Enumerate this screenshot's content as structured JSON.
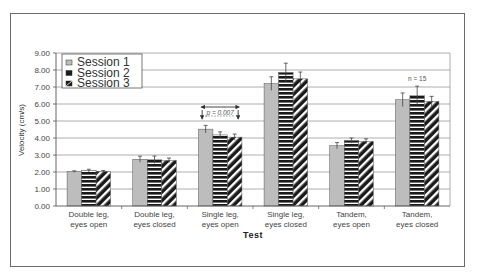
{
  "chart_data": {
    "type": "bar",
    "title": "",
    "xlabel": "Test",
    "ylabel": "Velocity (cm/s)",
    "ylim": [
      0,
      9
    ],
    "ytick_step": 1,
    "yticks": [
      "0.00",
      "1.00",
      "2.00",
      "3.00",
      "4.00",
      "5.00",
      "6.00",
      "7.00",
      "8.00",
      "9.00"
    ],
    "grid": true,
    "legend_position": "upper-left",
    "categories": [
      [
        "Double leg,",
        "eyes open"
      ],
      [
        "Double leg,",
        "eyes closed"
      ],
      [
        "Single leg,",
        "eyes open"
      ],
      [
        "Single leg,",
        "eyes closed"
      ],
      [
        "Tandem,",
        "eyes open"
      ],
      [
        "Tandem,",
        "eyes closed"
      ]
    ],
    "series": [
      {
        "name": "Session 1",
        "pattern": "solid-gray",
        "values": [
          2.02,
          2.75,
          4.52,
          7.2,
          3.55,
          6.25
        ],
        "errors": [
          0.05,
          0.18,
          0.22,
          0.4,
          0.18,
          0.4
        ]
      },
      {
        "name": "Session 2",
        "pattern": "horizontal-stripes",
        "values": [
          2.08,
          2.72,
          4.18,
          7.85,
          3.85,
          6.5
        ],
        "errors": [
          0.08,
          0.22,
          0.18,
          0.55,
          0.15,
          0.55
        ]
      },
      {
        "name": "Session 3",
        "pattern": "diagonal-stripes",
        "values": [
          2.03,
          2.68,
          4.05,
          7.48,
          3.8,
          6.15
        ],
        "errors": [
          0.06,
          0.14,
          0.18,
          0.4,
          0.15,
          0.3
        ]
      }
    ],
    "annotations": [
      {
        "text": "p = 0.007",
        "category_index": 2,
        "type": "bracket"
      },
      {
        "text": "n = 15",
        "category_index": 5,
        "type": "label"
      }
    ]
  },
  "colors": {
    "session1_fill": "#bdbdbd",
    "session2_fill": "#1a1a1a",
    "session3_fill": "#1a1a1a",
    "stripe": "#ffffff",
    "grid": "#9a9a9a",
    "frame": "#6a6a6a"
  }
}
